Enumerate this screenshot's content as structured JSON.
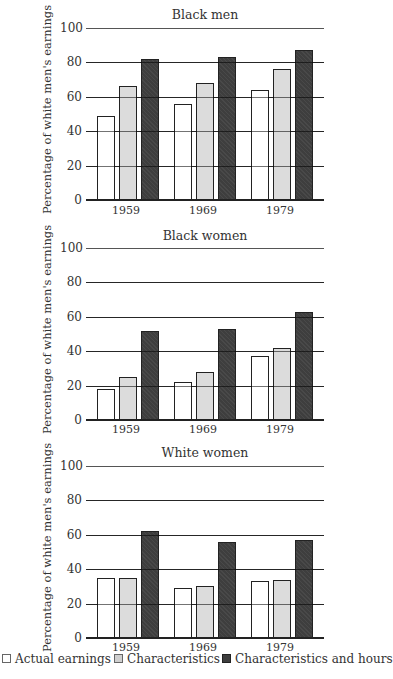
{
  "chart_data": [
    {
      "type": "bar",
      "title": "Black men",
      "xlabel": "",
      "ylabel": "Percentage of white men's earnings",
      "ylim": [
        0,
        100
      ],
      "yticks": [
        0,
        20,
        40,
        60,
        80,
        100
      ],
      "grid": true,
      "legend_position": "bottom",
      "categories": [
        "1959",
        "1969",
        "1979"
      ],
      "series": [
        {
          "name": "Actual earnings",
          "values": [
            49,
            56,
            64
          ]
        },
        {
          "name": "Characteristics",
          "values": [
            66,
            68,
            76
          ]
        },
        {
          "name": "Characteristics and hours",
          "values": [
            82,
            83,
            87
          ]
        }
      ]
    },
    {
      "type": "bar",
      "title": "Black women",
      "xlabel": "",
      "ylabel": "Percentage of white men's earnings",
      "ylim": [
        0,
        100
      ],
      "yticks": [
        0,
        20,
        40,
        60,
        80,
        100
      ],
      "grid": true,
      "legend_position": "bottom",
      "categories": [
        "1959",
        "1969",
        "1979"
      ],
      "series": [
        {
          "name": "Actual earnings",
          "values": [
            18,
            22,
            37
          ]
        },
        {
          "name": "Characteristics",
          "values": [
            25,
            28,
            42
          ]
        },
        {
          "name": "Characteristics and hours",
          "values": [
            52,
            53,
            63
          ]
        }
      ]
    },
    {
      "type": "bar",
      "title": "White women",
      "xlabel": "",
      "ylabel": "Percentage of white men's earnings",
      "ylim": [
        0,
        100
      ],
      "yticks": [
        0,
        20,
        40,
        60,
        80,
        100
      ],
      "grid": true,
      "legend_position": "bottom",
      "categories": [
        "1959",
        "1969",
        "1979"
      ],
      "series": [
        {
          "name": "Actual earnings",
          "values": [
            35,
            29,
            33
          ]
        },
        {
          "name": "Characteristics",
          "values": [
            35,
            30,
            34
          ]
        },
        {
          "name": "Characteristics and hours",
          "values": [
            62,
            56,
            57
          ]
        }
      ]
    }
  ],
  "panels": [
    {
      "title": "Black men",
      "ylabel": "Percentage of white men's earnings"
    },
    {
      "title": "Black women",
      "ylabel": "Percentage of white men's earnings"
    },
    {
      "title": "White women",
      "ylabel": "Percentage of white men's earnings"
    }
  ],
  "yticks": [
    "100",
    "80",
    "60",
    "40",
    "20",
    "0"
  ],
  "categories": [
    "1959",
    "1969",
    "1979"
  ],
  "legend": {
    "items": [
      {
        "label": "Actual earnings",
        "color": "#ffffff"
      },
      {
        "label": "Characteristics",
        "color": "#dcdcdc"
      },
      {
        "label": "Characteristics and hours",
        "color": "#3e3e3e"
      }
    ]
  }
}
